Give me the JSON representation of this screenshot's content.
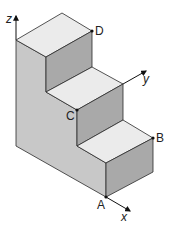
{
  "diagram": {
    "type": "isometric-staircase",
    "steps": 3,
    "colors": {
      "top_face": "#ebebeb",
      "side_face": "#c8c8c8",
      "front_face": "#a9a9a9",
      "edge": "#2a2a2a"
    },
    "axes": {
      "x": "x",
      "y": "y",
      "z": "z"
    },
    "points": {
      "A": "A",
      "B": "B",
      "C": "C",
      "D": "D"
    }
  }
}
